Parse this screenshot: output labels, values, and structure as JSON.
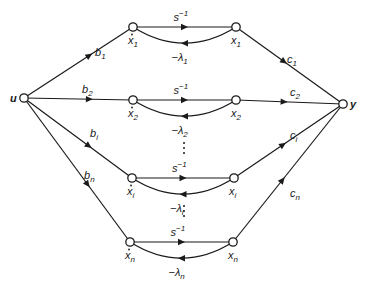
{
  "diagram": {
    "type": "signal-flow-graph",
    "input_node": {
      "label": "u"
    },
    "output_node": {
      "label": "y"
    },
    "branches": [
      {
        "id": "1",
        "input_gain": "b",
        "input_sub": "1",
        "state_dot": "x",
        "state_dot_sub": "1",
        "integrator": "s",
        "integrator_sup": "−1",
        "feedback": "−λ",
        "feedback_sub": "1",
        "state": "x",
        "state_sub": "1",
        "output_gain": "c",
        "output_sub": "1"
      },
      {
        "id": "2",
        "input_gain": "b",
        "input_sub": "2",
        "state_dot": "x",
        "state_dot_sub": "2",
        "integrator": "s",
        "integrator_sup": "−1",
        "feedback": "−λ",
        "feedback_sub": "2",
        "state": "x",
        "state_sub": "2",
        "output_gain": "c",
        "output_sub": "2"
      },
      {
        "id": "i",
        "input_gain": "b",
        "input_sub": "i",
        "state_dot": "x",
        "state_dot_sub": "i",
        "integrator": "s",
        "integrator_sup": "−1",
        "feedback": "−λ",
        "feedback_sub": "i",
        "state": "x",
        "state_sub": "i",
        "output_gain": "c",
        "output_sub": "i"
      },
      {
        "id": "n",
        "input_gain": "b",
        "input_sub": "n",
        "state_dot": "x",
        "state_dot_sub": "n",
        "integrator": "s",
        "integrator_sup": "−1",
        "feedback": "−λ",
        "feedback_sub": "n",
        "state": "x",
        "state_sub": "n",
        "output_gain": "c",
        "output_sub": "n"
      }
    ],
    "ellipsis": "⋮"
  }
}
